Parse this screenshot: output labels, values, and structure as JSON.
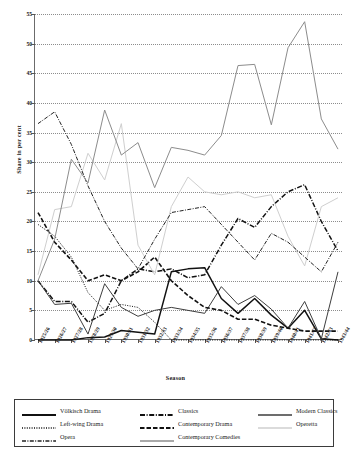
{
  "chart_data": {
    "type": "line",
    "title": "",
    "xlabel": "Season",
    "ylabel": "Share in per cent",
    "ylim": [
      0,
      55
    ],
    "ytick_step": 5,
    "yticks": [
      0,
      5,
      10,
      15,
      20,
      25,
      30,
      35,
      40,
      45,
      50,
      55
    ],
    "grid": true,
    "legend_position": "bottom",
    "categories": [
      "1925/26",
      "1926/27",
      "1927/28",
      "1928/29",
      "1929/30",
      "1930/31",
      "1931/32",
      "1932/33",
      "1933/34",
      "1934/35",
      "1935/36",
      "1936/37",
      "1937/38",
      "1938/39",
      "1939/40",
      "1940/41",
      "1941/42",
      "1942/43",
      "1943/44"
    ],
    "series": [
      {
        "name": "Völkisch Drama",
        "style": "solid-bold-black",
        "color": "#111111",
        "values": [
          0.0,
          0.0,
          0.0,
          0.4,
          0.5,
          1.6,
          1.3,
          1.0,
          11.5,
          12.0,
          12.2,
          7.0,
          4.5,
          7.0,
          4.2,
          2.0,
          5.0,
          0.2,
          0.0
        ]
      },
      {
        "name": "Classics",
        "style": "dash-dot-bold-black",
        "color": "#111111",
        "values": [
          10.0,
          6.5,
          6.5,
          3.0,
          4.5,
          10.0,
          12.0,
          11.5,
          12.0,
          10.5,
          11.0,
          16.0,
          20.5,
          19.0,
          22.5,
          25.0,
          26.2,
          20.0,
          15.0
        ]
      },
      {
        "name": "Modern Classics",
        "style": "solid-dark",
        "color": "#3d3d3d",
        "values": [
          10.0,
          6.0,
          6.2,
          1.0,
          9.5,
          5.5,
          4.0,
          5.0,
          5.5,
          5.0,
          4.5,
          9.0,
          6.0,
          7.5,
          5.2,
          2.0,
          6.5,
          0.2,
          11.5
        ]
      },
      {
        "name": "Left-wing Drama",
        "style": "dotted-black",
        "color": "#111111",
        "values": [
          19.5,
          17.5,
          14.0,
          8.0,
          5.0,
          6.0,
          5.5,
          3.0,
          0.0,
          0.0,
          0.0,
          0.0,
          0.0,
          0.0,
          0.0,
          0.0,
          0.0,
          0.0,
          0.0
        ]
      },
      {
        "name": "Contemporary Drama",
        "style": "dashed-bold-black",
        "color": "#111111",
        "values": [
          21.5,
          16.5,
          13.5,
          10.0,
          11.0,
          10.0,
          11.5,
          14.0,
          10.0,
          7.5,
          5.5,
          5.0,
          3.5,
          3.5,
          2.5,
          2.0,
          1.5,
          1.5,
          1.5
        ]
      },
      {
        "name": "Operetta",
        "style": "solid-light-gray",
        "color": "#cfcfcf",
        "values": [
          11.0,
          22.0,
          22.5,
          31.5,
          27.0,
          36.5,
          16.0,
          11.0,
          22.5,
          27.5,
          25.0,
          24.5,
          25.0,
          24.0,
          24.5,
          17.5,
          12.5,
          22.5,
          24.0
        ]
      },
      {
        "name": "Opera",
        "style": "dash-dot-thin-black",
        "color": "#222222",
        "values": [
          36.5,
          38.5,
          33.0,
          26.0,
          20.0,
          15.5,
          12.0,
          17.0,
          21.5,
          22.0,
          22.5,
          19.5,
          16.5,
          13.5,
          18.0,
          16.5,
          14.0,
          11.5,
          16.5
        ]
      },
      {
        "name": "Contemporary Comedies",
        "style": "solid-medium-gray",
        "color": "#8c8c8c",
        "values": [
          10.0,
          17.0,
          30.5,
          26.5,
          38.8,
          31.2,
          33.3,
          25.7,
          32.5,
          32.0,
          31.2,
          34.5,
          46.3,
          46.5,
          36.3,
          49.3,
          53.7,
          37.3,
          32.2
        ]
      }
    ]
  },
  "axis": {
    "ylabel": "Share in per cent",
    "xlabel": "Season",
    "yticks": [
      "0",
      "5",
      "10",
      "15",
      "20",
      "25",
      "30",
      "35",
      "40",
      "45",
      "50",
      "55"
    ],
    "xticks": [
      "1925/26",
      "1926/27",
      "1927/28",
      "1928/29",
      "1929/30",
      "1930/31",
      "1931/32",
      "1932/33",
      "1933/34",
      "1934/35",
      "1935/36",
      "1936/37",
      "1937/38",
      "1938/39",
      "1939/40",
      "1940/41",
      "1941/42",
      "1942/43",
      "1943/44"
    ]
  },
  "legend": {
    "rows": [
      [
        {
          "label": "Völkisch Drama",
          "style": "solid-bold-black"
        },
        {
          "label": "Classics",
          "style": "dash-dot-bold-black"
        },
        {
          "label": "Modern Classics",
          "style": "solid-dark"
        }
      ],
      [
        {
          "label": "Left-wing Drama",
          "style": "dotted-black"
        },
        {
          "label": "Contemporary Drama",
          "style": "dashed-bold-black"
        },
        {
          "label": "Operetta",
          "style": "solid-light-gray"
        }
      ],
      [
        {
          "label": "Opera",
          "style": "dash-dot-thin-black"
        },
        {
          "label": "Contemporary Comedies",
          "style": "solid-medium-gray"
        }
      ]
    ]
  }
}
